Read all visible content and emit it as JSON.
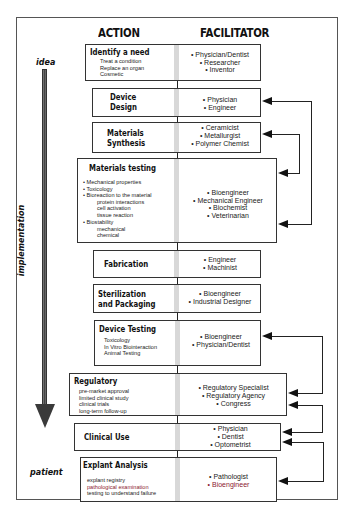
{
  "headers": {
    "action": "ACTION",
    "facilitator": "FACILITATOR"
  },
  "axis": {
    "start": "idea",
    "middle": "implementation",
    "end": "patient"
  },
  "steps": [
    {
      "title": [
        "Identify a need"
      ],
      "details": [
        "Treat a condition",
        "Replace an organ",
        "Cosmetic"
      ],
      "facilitators": [
        "• Physician/Dentist",
        "• Researcher",
        "• Inventor"
      ]
    },
    {
      "title": [
        "Device",
        "Design"
      ],
      "details": [],
      "facilitators": [
        "• Physician",
        "• Engineer"
      ]
    },
    {
      "title": [
        "Materials",
        "Synthesis"
      ],
      "details": [],
      "facilitators": [
        "• Ceramicist",
        "• Metallurgist",
        "• Polymer Chemist"
      ]
    },
    {
      "title": [
        "Materials testing"
      ],
      "details": [
        "• Mechanical properties",
        "• Toxicology",
        "• Bioreaction to the material",
        "protein interactions",
        "cell activation",
        "tissue reaction",
        "• Biostability",
        "mechanical",
        "chemical"
      ],
      "facilitators": [
        "• Bioengineer",
        "• Mechanical Engineer",
        "• Biochemist",
        "• Veterinarian"
      ]
    },
    {
      "title": [
        "Fabrication"
      ],
      "details": [],
      "facilitators": [
        "• Engineer",
        "• Machinist"
      ]
    },
    {
      "title": [
        "Sterilization",
        "and Packaging"
      ],
      "details": [],
      "facilitators": [
        "• Bioengineer",
        "• Industrial Designer"
      ]
    },
    {
      "title": [
        "Device Testing"
      ],
      "details": [
        "Toxicology",
        "In Vitro Biointeraction",
        "Animal Testing"
      ],
      "facilitators": [
        "• Bioengineer",
        "• Physician/Dentist"
      ]
    },
    {
      "title": [
        "Regulatory"
      ],
      "details": [
        "pre-market approval",
        "limited clinical study",
        "clinical trials",
        "long-term follow-up"
      ],
      "facilitators": [
        "• Regulatory Specialist",
        "• Regulatory Agency",
        "• Congress"
      ]
    },
    {
      "title": [
        "Clinical Use"
      ],
      "details": [],
      "facilitators": [
        "• Physician",
        "• Dentist",
        "• Optometrist"
      ]
    },
    {
      "title": [
        "Explant Analysis"
      ],
      "details": [
        "explant registry",
        "pathological examination",
        "testing to understand failure"
      ],
      "facilitators": [
        "• Pathologist",
        "• Bioengineer"
      ]
    }
  ],
  "feedback_loops": [
    {
      "from": "Materials testing",
      "to": "Device Design"
    },
    {
      "from": "Materials testing",
      "to": "Materials Synthesis"
    },
    {
      "from": "Regulatory",
      "to": "Device Testing"
    },
    {
      "from": "Clinical Use",
      "to": "Regulatory"
    },
    {
      "from": "Explant Analysis",
      "to": "Clinical Use"
    }
  ]
}
